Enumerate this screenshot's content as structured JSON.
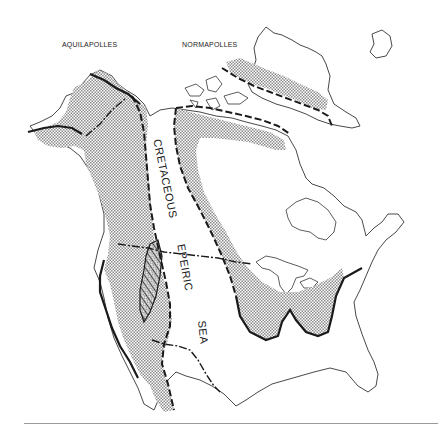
{
  "figure": {
    "type": "geologic-paleogeographic-map",
    "region": "North America",
    "labels": {
      "province_west": "AQUILAPOLLES",
      "province_east": "NORMAPOLLES",
      "seaway_word_1": "CRETACEOUS",
      "seaway_word_2": "EPEIRIC",
      "seaway_word_3": "SEA"
    },
    "legend_encoding": {
      "province_area_fill": "stippled gray",
      "overlap_area_fill": "diagonal hatch",
      "seaway_margin_line": "heavy dashed",
      "province_boundary_line": "dash-dot",
      "coastline": "thin solid"
    },
    "colors": {
      "stipple": "#b8b8b8",
      "ink": "#1a1a1a",
      "coast": "#333333",
      "background": "#ffffff",
      "rule": "#9a9a9a"
    }
  }
}
